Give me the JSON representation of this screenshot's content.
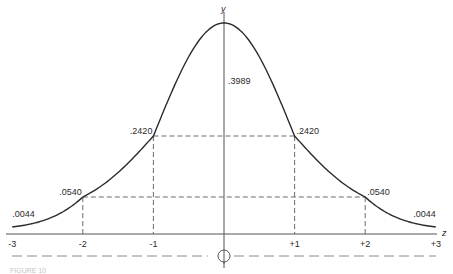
{
  "chart_data": {
    "type": "line",
    "title": "",
    "xlabel": "z",
    "ylabel": "y",
    "xlim": [
      -3,
      3
    ],
    "x_ticks": [
      {
        "value": -3,
        "label": "-3"
      },
      {
        "value": -2,
        "label": "-2"
      },
      {
        "value": -1,
        "label": "-1"
      },
      {
        "value": 1,
        "label": "+1"
      },
      {
        "value": 2,
        "label": "+2"
      },
      {
        "value": 3,
        "label": "+3"
      }
    ],
    "series": [
      {
        "name": "standard normal density",
        "points": [
          {
            "x": -3,
            "y": 0.0044,
            "label": ".0044"
          },
          {
            "x": -2,
            "y": 0.054,
            "label": ".0540"
          },
          {
            "x": -1,
            "y": 0.242,
            "label": ".2420"
          },
          {
            "x": 0,
            "y": 0.3989,
            "label": ".3989"
          },
          {
            "x": 1,
            "y": 0.242,
            "label": ".2420"
          },
          {
            "x": 2,
            "y": 0.054,
            "label": ".0540"
          },
          {
            "x": 3,
            "y": 0.0044,
            "label": ".0044"
          }
        ]
      }
    ],
    "reference_lines": [
      {
        "type": "horizontal",
        "y": 0.242,
        "from_x": -1,
        "to_x": 1
      },
      {
        "type": "horizontal",
        "y": 0.054,
        "from_x": -2,
        "to_x": 2
      },
      {
        "type": "vertical",
        "x": -2
      },
      {
        "type": "vertical",
        "x": -1
      },
      {
        "type": "vertical",
        "x": 1
      },
      {
        "type": "vertical",
        "x": 2
      }
    ],
    "grid": false,
    "legend": "none"
  },
  "caption": {
    "text": "FIGURE 10"
  }
}
